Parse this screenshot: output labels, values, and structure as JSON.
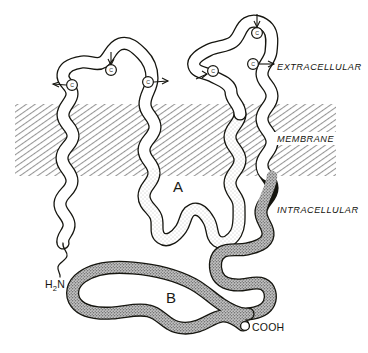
{
  "figure": {
    "compartments": {
      "extracellular_label": "EXTRACELLULAR",
      "membrane_label": "MEMBRANE",
      "intracellular_label": "INTRACELLULAR"
    },
    "termini": {
      "n_terminus_label": "H",
      "n_terminus_sub": "2",
      "n_terminus_tail": "N",
      "c_terminus_label": "COOH"
    },
    "domains": [
      {
        "id": "A",
        "label": "A",
        "fill": "light-stipple",
        "location": "intracellular-loop"
      },
      {
        "id": "B",
        "label": "B",
        "fill": "dark-stipple",
        "location": "intracellular-tail"
      }
    ],
    "glycosylation_sites": [
      {
        "label": "C",
        "stem": "left",
        "x": 72,
        "y": 85
      },
      {
        "label": "C",
        "stem": "up",
        "x": 111,
        "y": 70
      },
      {
        "label": "C",
        "stem": "right",
        "x": 148,
        "y": 82
      },
      {
        "label": "C",
        "stem": "left",
        "x": 213,
        "y": 71
      },
      {
        "label": "C",
        "stem": "up",
        "x": 257,
        "y": 33
      },
      {
        "label": "C",
        "stem": "right",
        "x": 253,
        "y": 64
      }
    ],
    "colors": {
      "ink": "#15150f",
      "membrane_hatch": "#9a9a9a",
      "domain_a_fill": "#efefef",
      "domain_b_fill": "#9d9d9d",
      "chain_fill": "#ffffff",
      "background": "#ffffff"
    },
    "membrane_band": {
      "top_y": 104,
      "bottom_y": 176,
      "left_x": 15,
      "right_x": 336
    }
  }
}
